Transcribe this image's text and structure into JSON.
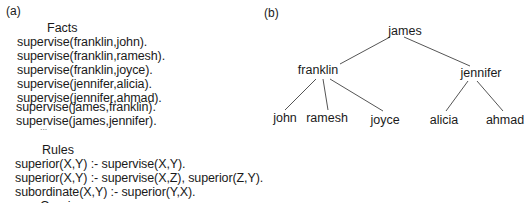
{
  "panel_a": {
    "label": "(a)",
    "facts": {
      "heading": "Facts",
      "lines": [
        "supervise(franklin,john).",
        "supervise(franklin,ramesh).",
        "supervise(franklin,joyce).",
        "supervise(jennifer,alicia).",
        "supervise(jennifer,ahmad).",
        "supervise(james,franklin).",
        "supervise(james,jennifer)."
      ],
      "ellipsis": "..."
    },
    "rules": {
      "heading": "Rules",
      "lines": [
        "superior(X,Y) :- supervise(X,Y).",
        "superior(X,Y) :- supervise(X,Z), superior(Z,Y).",
        "subordinate(X,Y) :- superior(Y,X)."
      ]
    },
    "queries": {
      "heading": "Queries"
    }
  },
  "panel_b": {
    "label": "(b)",
    "tree": {
      "root": "james",
      "level1": [
        "franklin",
        "jennifer"
      ],
      "franklin_children": [
        "john",
        "ramesh",
        "joyce"
      ],
      "jennifer_children": [
        "alicia",
        "ahmad"
      ]
    }
  }
}
